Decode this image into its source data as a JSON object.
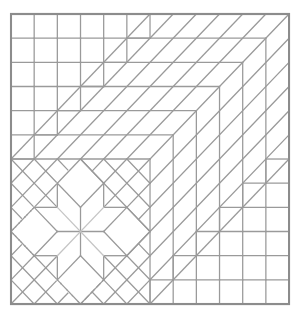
{
  "figure": {
    "grid_units": 12,
    "colors": {
      "line": "#9a9a9a",
      "faint_line": "#c4c4c4",
      "border": "#8c8c8c",
      "background": "#ffffff"
    },
    "regions": [
      {
        "name": "top-left staircase squares",
        "rows": [
          6,
          5,
          4,
          3,
          2,
          1
        ]
      },
      {
        "name": "diagonal strip bands",
        "count": 6
      },
      {
        "name": "eight-point star block",
        "size_units": 6,
        "position": "bottom-left"
      },
      {
        "name": "bottom-right staircase squares",
        "rows": [
          1,
          2,
          3,
          4,
          5,
          6
        ]
      }
    ]
  }
}
